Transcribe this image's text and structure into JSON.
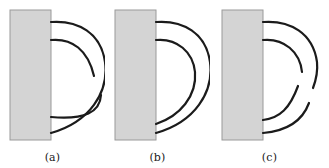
{
  "figure": {
    "type": "diagram",
    "background_color": "#ffffff",
    "stroke_color": "#1b1b1b",
    "slab_fill_color": "#d4d4d4",
    "slab_border_color": "#9a9a9a"
  },
  "panels": [
    {
      "id": "panel-a",
      "label": "(a)",
      "offset_x": 0,
      "slab": {
        "x": 10,
        "y": 10,
        "width": 41,
        "height": 130
      },
      "strands": [
        {
          "name": "outer-loop",
          "state": "complete",
          "path": "M 51 22 C 78 20, 101 33, 105 62 C 109 92, 90 122, 51 133"
        },
        {
          "name": "inner-strand-upper",
          "state": "broken",
          "path": "M 51 40 C 72 38, 88 50, 94 76"
        },
        {
          "name": "inner-strand-lower",
          "state": "broken",
          "path": "M 101 95 C 100 112, 85 120, 51 117"
        }
      ]
    },
    {
      "id": "panel-b",
      "label": "(b)",
      "offset_x": 105,
      "slab": {
        "x": 10,
        "y": 10,
        "width": 41,
        "height": 130
      },
      "strands": [
        {
          "name": "outer-loop",
          "state": "complete",
          "path": "M 51 22 C 78 20, 101 33, 105 62 C 109 92, 90 122, 51 133"
        },
        {
          "name": "inner-loop",
          "state": "complete",
          "path": "M 51 40 C 72 38, 88 52, 90 72 C 92 96, 75 116, 51 124"
        }
      ]
    },
    {
      "id": "panel-c",
      "label": "(c)",
      "offset_x": 210,
      "slab": {
        "x": 12,
        "y": 10,
        "width": 41,
        "height": 130
      },
      "strands": [
        {
          "name": "outer-strand-upper",
          "state": "broken",
          "path": "M 53 22 C 80 20, 103 33, 107 62 C 108 72, 106 80, 103 88"
        },
        {
          "name": "outer-strand-lower",
          "state": "broken",
          "path": "M 99 103 C 92 122, 76 131, 53 133"
        },
        {
          "name": "inner-strand-upper",
          "state": "broken",
          "path": "M 53 40 C 74 38, 90 52, 92 72"
        },
        {
          "name": "inner-strand-lower",
          "state": "broken",
          "path": "M 88 86 C 80 108, 70 118, 53 120"
        }
      ]
    }
  ]
}
